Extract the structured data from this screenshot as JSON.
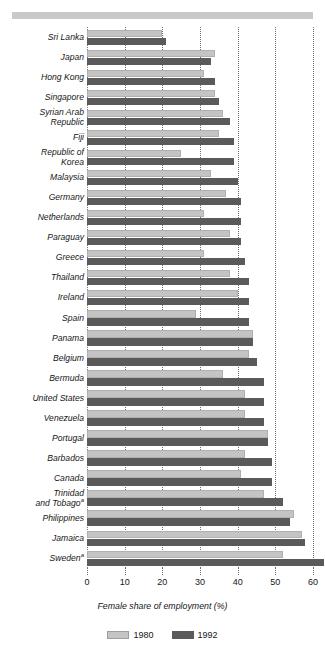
{
  "chart_data": {
    "type": "bar",
    "orientation": "horizontal",
    "title": "",
    "xlabel": "Female share of employment (%)",
    "ylabel": "",
    "xlim": [
      0,
      65
    ],
    "xticks": [
      0,
      10,
      20,
      30,
      40,
      50,
      60
    ],
    "xticklabels": [
      "0",
      "10",
      "20",
      "30",
      "40",
      "50",
      "60"
    ],
    "grid": true,
    "grid_axis": "x",
    "grid_style": "dotted",
    "legend_position": "bottom",
    "categories": [
      "Sri Lanka",
      "Japan",
      "Hong Kong",
      "Singapore",
      "Syrian Arab Republic",
      "Fiji",
      "Republic of Korea",
      "Malaysia",
      "Germany",
      "Netherlands",
      "Paraguay",
      "Greece",
      "Thailand",
      "Ireland",
      "Spain",
      "Panama",
      "Belgium",
      "Bermuda",
      "United States",
      "Venezuela",
      "Portugal",
      "Barbados",
      "Canada",
      "Trinidad and Tobago",
      "Philippines",
      "Jamaica",
      "Sweden"
    ],
    "category_lines": [
      [
        "Sri Lanka"
      ],
      [
        "Japan"
      ],
      [
        "Hong Kong"
      ],
      [
        "Singapore"
      ],
      [
        "Syrian Arab",
        "Republic"
      ],
      [
        "Fiji"
      ],
      [
        "Republic of",
        "Korea"
      ],
      [
        "Malaysia"
      ],
      [
        "Germany"
      ],
      [
        "Netherlands"
      ],
      [
        "Paraguay"
      ],
      [
        "Greece"
      ],
      [
        "Thailand"
      ],
      [
        "Ireland"
      ],
      [
        "Spain"
      ],
      [
        "Panama"
      ],
      [
        "Belgium"
      ],
      [
        "Bermuda"
      ],
      [
        "United States"
      ],
      [
        "Venezuela"
      ],
      [
        "Portugal"
      ],
      [
        "Barbados"
      ],
      [
        "Canada"
      ],
      [
        "Trinidad",
        "and Tobago"
      ],
      [
        "Philippines"
      ],
      [
        "Jamaica"
      ],
      [
        "Sweden"
      ]
    ],
    "footnote_markers": {
      "Trinidad and Tobago": "a",
      "Sweden": "a"
    },
    "series": [
      {
        "name": "1980",
        "color": "#c4c4c4",
        "values": [
          20,
          34,
          31,
          34,
          36,
          35,
          25,
          33,
          37,
          31,
          38,
          31,
          38,
          40,
          29,
          44,
          43,
          36,
          42,
          42,
          48,
          42,
          41,
          47,
          55,
          57,
          52
        ]
      },
      {
        "name": "1992",
        "color": "#5a5a5a",
        "values": [
          21,
          33,
          34,
          35,
          38,
          39,
          39,
          40,
          41,
          41,
          41,
          42,
          43,
          43,
          43,
          44,
          45,
          47,
          47,
          47,
          48,
          49,
          49,
          52,
          54,
          58,
          63
        ]
      }
    ],
    "legend": [
      {
        "label": "1980",
        "color": "#c4c4c4"
      },
      {
        "label": "1992",
        "color": "#5a5a5a"
      }
    ]
  },
  "style": {
    "bar_light": "#c4c4c4",
    "bar_dark": "#5a5a5a",
    "grid_color": "#6e6e6e",
    "rule_color": "#c9c9c9",
    "text_color": "#161616",
    "background": "#ffffff"
  }
}
